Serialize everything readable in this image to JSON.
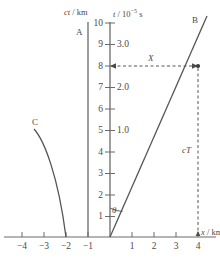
{
  "figure": {
    "type": "minkowski-spacetime-diagram",
    "axes": {
      "x_axis": {
        "title_var": "x",
        "title_unit": "km",
        "title_sep": " / ",
        "title_full": "x / km",
        "ticks": [
          {
            "label": "−4",
            "value": -4
          },
          {
            "label": "−3",
            "value": -3
          },
          {
            "label": "−2",
            "value": -2
          },
          {
            "label": "−1",
            "value": -1
          },
          {
            "label": "1",
            "value": 1
          },
          {
            "label": "2",
            "value": 2
          },
          {
            "label": "3",
            "value": 3
          },
          {
            "label": "4",
            "value": 4
          }
        ],
        "range": [
          -4.7,
          4.6
        ]
      },
      "ct_axis": {
        "title_var": "ct",
        "title_unit": "km",
        "title_sep": " / ",
        "title_full": "ct / km",
        "ticks": [
          {
            "label": "1",
            "value": 1
          },
          {
            "label": "2",
            "value": 2
          },
          {
            "label": "3",
            "value": 3
          },
          {
            "label": "4",
            "value": 4
          },
          {
            "label": "5",
            "value": 5
          },
          {
            "label": "6",
            "value": 6
          },
          {
            "label": "7",
            "value": 7
          },
          {
            "label": "8",
            "value": 8
          },
          {
            "label": "9",
            "value": 9
          },
          {
            "label": "10",
            "value": 10
          }
        ],
        "range": [
          0,
          10.6
        ]
      },
      "t_axis": {
        "title_var": "t",
        "title_unit": "10−5 s",
        "title_unit_base": "10",
        "title_unit_exp": "−5",
        "title_unit_suffix": " s",
        "title_sep": " / ",
        "title_full": "t / 10−5 s",
        "ticks": [
          {
            "label": "1.0",
            "value": 1.0,
            "ct_equiv": 3
          },
          {
            "label": "2.0",
            "value": 2.0,
            "ct_equiv": 6
          },
          {
            "label": "3.0",
            "value": 3.0,
            "ct_equiv": 9
          }
        ],
        "minor_ticks_ct": [
          1,
          2,
          4,
          5,
          7,
          8,
          10
        ]
      }
    },
    "worldlines": [
      {
        "name": "A",
        "label": "A",
        "style": "solid-vertical",
        "x_km": -1,
        "description": "vertical worldline at x = -1 km"
      },
      {
        "name": "B",
        "label": "B",
        "style": "solid-straight",
        "from": {
          "x": 0,
          "ct": 0
        },
        "to": {
          "x": 4.4,
          "ct": 10.3
        },
        "description": "straight worldline through origin"
      },
      {
        "name": "C",
        "label": "C",
        "style": "solid-curved",
        "from": {
          "x": -3.4,
          "ct": 5.1
        },
        "to": {
          "x": -2,
          "ct": 0
        },
        "description": "curved worldline ending at x = -2 km"
      }
    ],
    "annotations": [
      {
        "name": "event-point",
        "label": "",
        "x_km": 4,
        "ct_km": 8,
        "marker": "dot"
      },
      {
        "name": "horizontal-span",
        "label": "X",
        "style": "dashed-double-arrow",
        "from": {
          "x": 0,
          "ct": 8
        },
        "to": {
          "x": 4,
          "ct": 8
        }
      },
      {
        "name": "vertical-span",
        "label": "cT",
        "style": "dashed",
        "from": {
          "x": 4,
          "ct": 0
        },
        "to": {
          "x": 4,
          "ct": 8
        }
      },
      {
        "name": "angle",
        "label": "θ",
        "style": "arc",
        "vertex": {
          "x": 0,
          "ct": 0
        },
        "between": [
          "ct-axis",
          "worldline-B"
        ]
      }
    ],
    "colors": {
      "line": "#555555",
      "axis": "#6b6b6b",
      "text": "#4a4a4a",
      "background": "#ffffff"
    }
  }
}
